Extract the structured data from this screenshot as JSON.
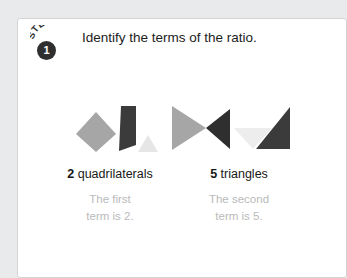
{
  "card": {
    "step": {
      "word": "STEP",
      "number": "1",
      "title": "Identify the terms of the ratio."
    },
    "groups": [
      {
        "id": "quadrilaterals",
        "count": "2",
        "noun": "quadrilaterals",
        "caption_line1": "The first",
        "caption_line2": "term is 2.",
        "shapes": [
          {
            "name": "gray-diamond",
            "kind": "quadrilateral",
            "color": "#a6a6a6"
          },
          {
            "name": "dark-gray-trapezoid",
            "kind": "quadrilateral",
            "color": "#3b3b3b"
          },
          {
            "name": "light-gray-triangle",
            "kind": "triangle",
            "color": "#e6e6e6"
          }
        ]
      },
      {
        "id": "triangles",
        "count": "5",
        "noun": "triangles",
        "caption_line1": "The second",
        "caption_line2": "term is 5.",
        "shapes": [
          {
            "name": "gray-right-triangle",
            "kind": "triangle",
            "color": "#a6a6a6"
          },
          {
            "name": "dark-left-triangle",
            "kind": "triangle",
            "color": "#2f2f2f"
          },
          {
            "name": "very-light-down-triangle",
            "kind": "triangle",
            "color": "#ededed"
          },
          {
            "name": "dark-right-angle-triangle",
            "kind": "triangle",
            "color": "#3b3b3b"
          }
        ]
      }
    ]
  },
  "colors": {
    "page_background": "#e9eaeb",
    "card_background": "#ffffff",
    "card_border": "#d2d3d4",
    "badge_fill": "#2f2f2f",
    "caption_text": "#b9babb",
    "title_text": "#1c1c1c"
  }
}
